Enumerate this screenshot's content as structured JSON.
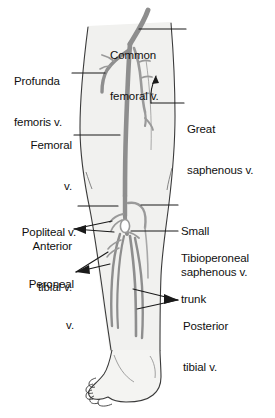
{
  "figure": {
    "colors": {
      "background": "#ffffff",
      "skin_fill": "#f2f2f0",
      "outline": "#3a3a3a",
      "vein": "#8e8e8e",
      "vein_dark": "#6f6f6f",
      "label_text": "#101010",
      "leader_line": "#1a1a1a"
    },
    "labels": [
      {
        "id": "common-femoral-v",
        "name": "common-femoral-vein-label",
        "lines": [
          "Common",
          "femoral v."
        ],
        "side": "right",
        "x": 189,
        "y": 22
      },
      {
        "id": "profunda-femoris-v",
        "name": "profunda-femoris-vein-label",
        "lines": [
          "Profunda",
          "femoris v."
        ],
        "side": "left",
        "x": 14,
        "y": 48
      },
      {
        "id": "great-saphenous-v",
        "name": "great-saphenous-vein-label",
        "lines": [
          "Great",
          "saphenous v."
        ],
        "side": "right",
        "x": 187,
        "y": 96
      },
      {
        "id": "femoral-v",
        "name": "femoral-vein-label",
        "lines": [
          "Femoral",
          "v."
        ],
        "side": "left",
        "x": 32,
        "y": 112
      },
      {
        "id": "popliteal-v",
        "name": "popliteal-vein-label",
        "lines": [
          "Popliteal v."
        ],
        "side": "left",
        "x": 9,
        "y": 200
      },
      {
        "id": "anterior-tibial-v",
        "name": "anterior-tibial-vein-label",
        "lines": [
          "Anterior",
          "tibial v."
        ],
        "side": "left",
        "x": 20,
        "y": 214
      },
      {
        "id": "small-saphenous-v",
        "name": "small-saphenous-vein-label",
        "lines": [
          "Small",
          "saphenous v."
        ],
        "side": "right",
        "x": 181,
        "y": 199
      },
      {
        "id": "tibioperoneal-trunk",
        "name": "tibioperoneal-trunk-label",
        "lines": [
          "Tibioperoneal",
          "trunk"
        ],
        "side": "right",
        "x": 181,
        "y": 227
      },
      {
        "id": "peroneal-v",
        "name": "peroneal-vein-label",
        "lines": [
          "Peroneal",
          "v."
        ],
        "side": "left",
        "x": 25,
        "y": 252
      },
      {
        "id": "posterior-tibial-v",
        "name": "posterior-tibial-vein-label",
        "lines": [
          "Posterior",
          "tibial v."
        ],
        "side": "right",
        "x": 181,
        "y": 294
      }
    ],
    "vessels": [
      {
        "id": "common-femoral-v",
        "name": "common-femoral-vein",
        "label": "Common femoral v."
      },
      {
        "id": "profunda-femoris-v",
        "name": "profunda-femoris-vein",
        "label": "Profunda femoris v."
      },
      {
        "id": "great-saphenous-v",
        "name": "great-saphenous-vein",
        "label": "Great saphenous v."
      },
      {
        "id": "femoral-v",
        "name": "femoral-vein",
        "label": "Femoral v."
      },
      {
        "id": "popliteal-v",
        "name": "popliteal-vein",
        "label": "Popliteal v."
      },
      {
        "id": "anterior-tibial-v",
        "name": "anterior-tibial-vein",
        "label": "Anterior tibial v."
      },
      {
        "id": "small-saphenous-v",
        "name": "small-saphenous-vein",
        "label": "Small saphenous v."
      },
      {
        "id": "tibioperoneal-trunk",
        "name": "tibioperoneal-trunk",
        "label": "Tibioperoneal trunk"
      },
      {
        "id": "peroneal-v",
        "name": "peroneal-vein",
        "label": "Peroneal v."
      },
      {
        "id": "posterior-tibial-v",
        "name": "posterior-tibial-vein",
        "label": "Posterior tibial v."
      }
    ]
  }
}
